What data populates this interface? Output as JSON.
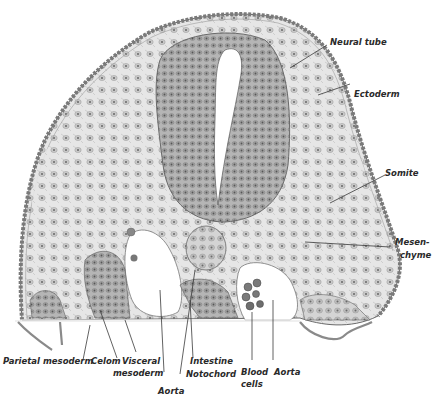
{
  "figure": {
    "labels": {
      "neural_tube": "Neural tube",
      "ectoderm": "Ectoderm",
      "somite": "Somite",
      "mesenchyme_1": "Mesen-",
      "mesenchyme_2": "chyme",
      "parietal_mesoderm": "Parietal mesoderm",
      "celom": "Celom",
      "visceral_mesoderm_1": "Visceral",
      "visceral_mesoderm_2": "mesoderm",
      "aorta_left": "Aorta",
      "intestine": "Intestine",
      "notochord": "Notochord",
      "blood_cells_1": "Blood",
      "blood_cells_2": "cells",
      "aorta_right": "Aorta"
    },
    "colors": {
      "background": "#ffffff",
      "tissue_light": "#e4e4e4",
      "tissue_mid": "#b8b8b8",
      "tissue_dark": "#7a7a7a",
      "label_text": "#2a2a2a"
    }
  }
}
